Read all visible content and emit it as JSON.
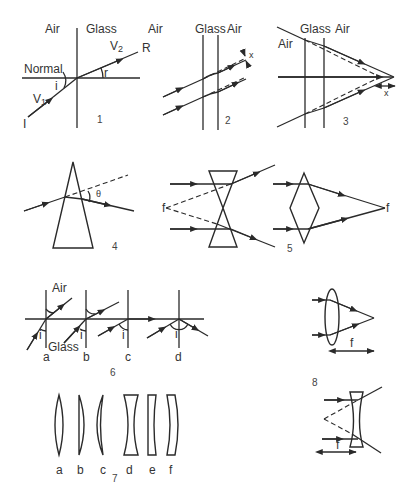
{
  "figure": {
    "panel1": {
      "number": "1",
      "medium_left": "Air",
      "medium_right": "Glass",
      "normal_label": "Normal",
      "incident_label": "I",
      "refracted_label": "R",
      "velocity1": "V",
      "velocity1_sub": "1",
      "velocity2": "V",
      "velocity2_sub": "2",
      "angle_incidence": "i",
      "angle_refraction": "r"
    },
    "panel2": {
      "number": "2",
      "medium_left": "Air",
      "medium_mid": "Glass",
      "medium_right": "Air",
      "shift_label": "x"
    },
    "panel3": {
      "number": "3",
      "medium_left": "Air",
      "medium_mid": "Glass",
      "medium_right": "Air",
      "shift_label": "x"
    },
    "panel4": {
      "number": "4",
      "deviation_label": "θ"
    },
    "panel5": {
      "number": "5",
      "focus_left": "f",
      "focus_right": "f"
    },
    "panel6": {
      "number": "6",
      "medium_top": "Air",
      "medium_bottom": "Glass",
      "cases": [
        "a",
        "b",
        "c",
        "d"
      ],
      "angle_label": "i"
    },
    "panel7": {
      "number": "7",
      "lenses": [
        "a",
        "b",
        "c",
        "d",
        "e",
        "f"
      ]
    },
    "panel8": {
      "number": "8",
      "focal_label_top": "f",
      "focal_label_bottom": "f"
    }
  }
}
